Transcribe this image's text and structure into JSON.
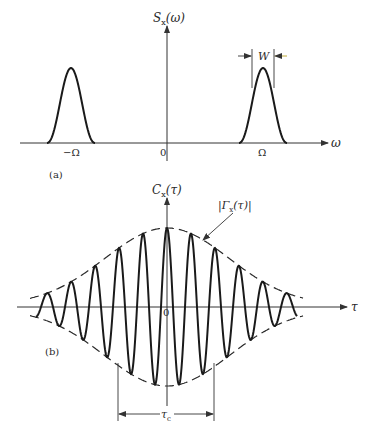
{
  "panel_a": {
    "label": "(a)",
    "y_axis_label": "S",
    "y_axis_sub": "x",
    "y_axis_arg": "(ω)",
    "x_axis_label": "ω",
    "origin_label": "0",
    "neg_peak_label": "−Ω",
    "pos_peak_label": "Ω",
    "width_label": "W",
    "colors": {
      "curve": "#1a1a1a",
      "axis": "#333333",
      "arrow_accent": "#b8a020"
    },
    "geometry": {
      "axis_y": 143,
      "axis_x0": 20,
      "axis_x1": 328,
      "vaxis_x": 167,
      "vaxis_top": 26,
      "vaxis_bottom": 161,
      "peaks": [
        {
          "cx": 71,
          "half_base": 24
        },
        {
          "cx": 263,
          "half_base": 24
        }
      ],
      "peak_height": 75
    }
  },
  "panel_b": {
    "label": "(b)",
    "y_axis_label": "C",
    "y_axis_sub": "x",
    "y_axis_arg": "(τ)",
    "x_axis_label": "τ",
    "origin_label": "0",
    "envelope_label": "|Γ",
    "envelope_sub": "x",
    "envelope_arg": "(τ)|",
    "coherence_label": "τ",
    "coherence_sub": "c",
    "geometry": {
      "axis_y": 307,
      "axis_x0": 17,
      "axis_x1": 347,
      "vaxis_x": 167,
      "vaxis_top": 198,
      "vaxis_bottom": 406,
      "amplitude": 77,
      "sigma": 62,
      "period": 24,
      "x_start": 36,
      "x_end": 297,
      "tau_c_left": 118,
      "tau_c_right": 214,
      "tau_c_y": 414
    }
  },
  "chart_data": [
    {
      "type": "line",
      "title": "(a) Power spectral density S_x(ω)",
      "xlabel": "ω",
      "ylabel": "S_x(ω)",
      "x_ticks": [
        "−Ω",
        "0",
        "Ω"
      ],
      "series": [
        {
          "name": "S_x(ω)",
          "shape": "two gaussian bumps centred at −Ω and Ω, bandwidth W",
          "centers": [
            "−Ω",
            "Ω"
          ],
          "relative_height": 1.0
        }
      ],
      "annotations": [
        "W (bandwidth between arrows at peak Ω)"
      ]
    },
    {
      "type": "line",
      "title": "(b) Autocovariance C_x(τ)",
      "xlabel": "τ",
      "ylabel": "C_x(τ)",
      "x_ticks": [
        "0"
      ],
      "series": [
        {
          "name": "C_x(τ)",
          "shape": "cosine oscillation under gaussian envelope, ~11 peaks visible",
          "relative_peak_at_0": 1.0
        },
        {
          "name": "|Γ_x(τ)|",
          "style": "dashed",
          "shape": "gaussian envelope ±"
        }
      ],
      "annotations": [
        "|Γ_x(τ)| (arrow to envelope)",
        "τ_c (coherence time, width marker)"
      ]
    }
  ]
}
